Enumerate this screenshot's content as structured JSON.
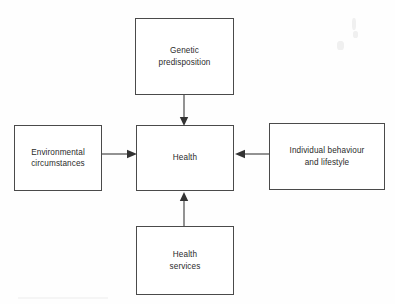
{
  "diagram": {
    "type": "influence-diagram",
    "center": {
      "id": "health",
      "label": "Health"
    },
    "nodes": [
      {
        "id": "genetic",
        "label": "Genetic\npredisposition",
        "position": "top"
      },
      {
        "id": "environment",
        "label": "Environmental\ncircumstances",
        "position": "left"
      },
      {
        "id": "health",
        "label": "Health",
        "position": "center"
      },
      {
        "id": "individual",
        "label": "Individual behaviour\nand lifestyle",
        "position": "right"
      },
      {
        "id": "services",
        "label": "Health\nservices",
        "position": "bottom"
      }
    ],
    "edges": [
      {
        "id": "genetic-health",
        "from": "genetic",
        "to": "health",
        "direction": "down",
        "arrowhead": "filled-triangle"
      },
      {
        "id": "environment-health",
        "from": "environment",
        "to": "health",
        "direction": "right",
        "arrowhead": "filled-triangle"
      },
      {
        "id": "individual-health",
        "from": "individual",
        "to": "health",
        "direction": "left",
        "arrowhead": "filled-triangle"
      },
      {
        "id": "services-health",
        "from": "services",
        "to": "health",
        "direction": "up",
        "arrowhead": "filled-triangle"
      }
    ],
    "colors": {
      "background": "#fefefe",
      "box_border": "#4a4a4a",
      "box_fill": "#ffffff",
      "text": "#2b2b2b",
      "connector": "#4a4a4a"
    }
  }
}
